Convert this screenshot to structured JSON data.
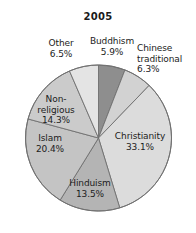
{
  "chart_data": {
    "type": "pie",
    "title": "2005",
    "xlabel": "",
    "ylabel": "",
    "legend_position": "none",
    "grid": false,
    "unit": "%",
    "start_angle_deg": 0,
    "direction": "clockwise",
    "categories": [
      "Buddhism",
      "Chinese traditional",
      "Christianity",
      "Hinduism",
      "Islam",
      "Non-religious",
      "Other"
    ],
    "values": [
      5.9,
      6.3,
      33.1,
      13.5,
      20.4,
      14.3,
      6.5
    ],
    "slices": [
      {
        "name": "Buddhism",
        "value": 5.9,
        "label": "Buddhism\n5.9%",
        "color": "#8e8e8e"
      },
      {
        "name": "Chinese traditional",
        "value": 6.3,
        "label": "Chinese\ntraditional\n6.3%",
        "color": "#d2d2d2"
      },
      {
        "name": "Christianity",
        "value": 33.1,
        "label": "Christianity\n33.1%",
        "color": "#dcdcdc"
      },
      {
        "name": "Hinduism",
        "value": 13.5,
        "label": "Hinduism\n13.5%",
        "color": "#b4b4b4"
      },
      {
        "name": "Islam",
        "value": 20.4,
        "label": "Islam\n20.4%",
        "color": "#c4c4c4"
      },
      {
        "name": "Non-religious",
        "value": 14.3,
        "label": "Non-\nreligious\n14.3%",
        "color": "#cbcbcb"
      },
      {
        "name": "Other",
        "value": 6.5,
        "label": "Other\n6.5%",
        "color": "#e4e4e4"
      }
    ],
    "geometry": {
      "cx": 98.5,
      "cy": 138,
      "r": 73
    },
    "stroke_color": "#6f6f6f",
    "text_color": "#1c1c1c",
    "background": "#ffffff"
  }
}
